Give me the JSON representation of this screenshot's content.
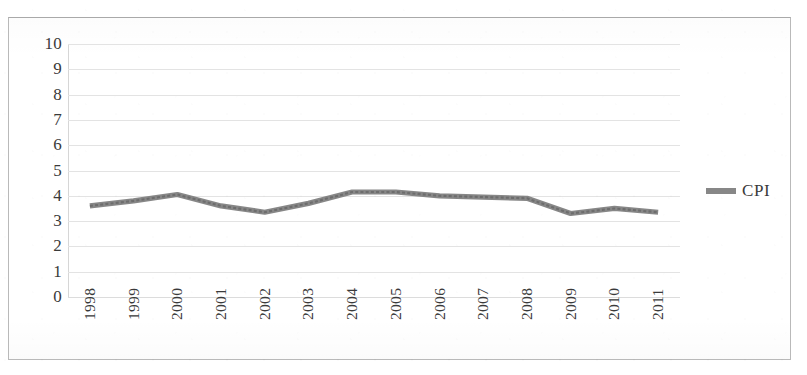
{
  "chart_data": {
    "type": "line",
    "title": "",
    "xlabel": "",
    "ylabel": "",
    "categories": [
      "1998",
      "1999",
      "2000",
      "2001",
      "2002",
      "2003",
      "2004",
      "2005",
      "2006",
      "2007",
      "2008",
      "2009",
      "2010",
      "2011"
    ],
    "series": [
      {
        "name": "CPI",
        "values": [
          3.6,
          3.8,
          4.05,
          3.6,
          3.35,
          3.7,
          4.15,
          4.15,
          4.0,
          3.95,
          3.9,
          3.3,
          3.5,
          3.35
        ],
        "color": "#7d7d7d"
      }
    ],
    "ylim": [
      0,
      10
    ],
    "y_ticks": [
      "10",
      "9",
      "8",
      "7",
      "6",
      "5",
      "4",
      "3",
      "2",
      "1",
      "0"
    ],
    "grid": true,
    "legend_position": "right"
  },
  "legend": {
    "entries": [
      {
        "label": "CPI",
        "color": "#7d7d7d",
        "marker": "line-swatch"
      }
    ]
  },
  "axes": {
    "y_tick_labels": [
      "10",
      "9",
      "8",
      "7",
      "6",
      "5",
      "4",
      "3",
      "2",
      "1",
      "0"
    ],
    "x_tick_labels": [
      "1998",
      "1999",
      "2000",
      "2001",
      "2002",
      "2003",
      "2004",
      "2005",
      "2006",
      "2007",
      "2008",
      "2009",
      "2010",
      "2011"
    ]
  },
  "style": {
    "frame_color": "#b9b9b9",
    "gridline_color": "#e3e3e3",
    "text_color": "#3a3a3a",
    "background": "#ffffff"
  }
}
